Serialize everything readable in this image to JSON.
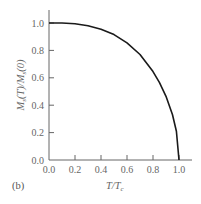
{
  "panel_label": "(b)",
  "chart_data": {
    "type": "line",
    "title": "",
    "xlabel": "T/T_c",
    "ylabel": "M_s(T)/M_s(0)",
    "xlim": [
      0.0,
      1.08
    ],
    "ylim": [
      0.0,
      1.1
    ],
    "grid": false,
    "legend": null,
    "x_ticks": [
      "0.0",
      "0.2",
      "0.4",
      "0.6",
      "0.8",
      "1.0"
    ],
    "y_ticks": [
      "0.0",
      "0.2",
      "0.4",
      "0.6",
      "0.8",
      "1.0"
    ],
    "series": [
      {
        "name": "Spontaneous magnetization (mean-field)",
        "color": "#1a1a1a",
        "x": [
          0.0,
          0.1,
          0.2,
          0.3,
          0.4,
          0.5,
          0.6,
          0.7,
          0.8,
          0.85,
          0.9,
          0.95,
          0.98,
          1.0
        ],
        "y": [
          1.0,
          1.0,
          0.995,
          0.98,
          0.955,
          0.915,
          0.855,
          0.77,
          0.645,
          0.565,
          0.465,
          0.33,
          0.21,
          0.0
        ]
      }
    ]
  },
  "labels": {
    "x_title_main": "T/T",
    "x_title_sub": "c",
    "y_title_a": "M",
    "y_title_a_sub": "s",
    "y_title_b": "(T)/M",
    "y_title_b_sub": "s",
    "y_title_c": "(0)"
  }
}
